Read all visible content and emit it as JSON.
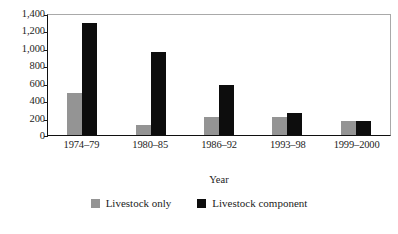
{
  "chart_data": {
    "type": "bar",
    "title": "",
    "subtitle": "",
    "xlabel": "Year",
    "ylabel": "",
    "categories": [
      "1974–79",
      "1980–85",
      "1986–92",
      "1993–98",
      "1999–2000"
    ],
    "series": [
      {
        "name": "Livestock only",
        "color": "#949494",
        "values": [
          480,
          120,
          210,
          210,
          165
        ]
      },
      {
        "name": "Livestock component",
        "color": "#0d0d0d",
        "values": [
          1290,
          955,
          575,
          250,
          165
        ]
      }
    ],
    "ylim": [
      0,
      1400
    ],
    "ytick_values": [
      0,
      200,
      400,
      600,
      800,
      1000,
      1200,
      1400
    ],
    "ytick_labels": [
      "0",
      "200",
      "400",
      "600",
      "800",
      "1,000",
      "1,200",
      "1,400"
    ],
    "grid": false,
    "legend_position": "bottom-center",
    "bar_style": "grouped"
  },
  "axis": {
    "y_labels": [
      "1,400",
      "1,200",
      "1,000",
      "800",
      "600",
      "400",
      "200",
      "0"
    ],
    "x_labels": [
      "1974–79",
      "1980–85",
      "1986–92",
      "1993–98",
      "1999–2000"
    ],
    "x_title": "Year"
  },
  "legend": {
    "items": [
      {
        "label": "Livestock only",
        "color": "#949494"
      },
      {
        "label": "Livestock component",
        "color": "#0d0d0d"
      }
    ]
  },
  "caption": {
    "partial_text": ""
  }
}
